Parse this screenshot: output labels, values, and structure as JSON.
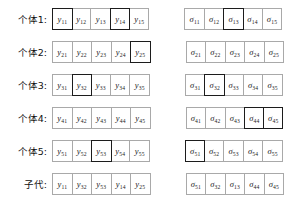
{
  "figure": {
    "type": "genetic-algorithm-crossover-diagram",
    "colors": {
      "cell_border": "#a9a9a9",
      "highlight_border": "#1c1c1c",
      "background": "#ffffff",
      "text": "#1a1a1a"
    },
    "columns": 5
  },
  "labels": {
    "individual_1": "个体1:",
    "individual_2": "个体2:",
    "individual_3": "个体3:",
    "individual_4": "个体4:",
    "individual_5": "个体5:",
    "offspring": "子代:"
  },
  "symbols": {
    "y": "y",
    "sigma": "σ"
  },
  "rows": [
    {
      "label_key": "individual_1",
      "y_cells": [
        {
          "base": "y",
          "sub": "11",
          "highlighted": true
        },
        {
          "base": "y",
          "sub": "12",
          "highlighted": false
        },
        {
          "base": "y",
          "sub": "13",
          "highlighted": false
        },
        {
          "base": "y",
          "sub": "14",
          "highlighted": true
        },
        {
          "base": "y",
          "sub": "15",
          "highlighted": false
        }
      ],
      "sigma_cells": [
        {
          "base": "σ",
          "sub": "11",
          "highlighted": false
        },
        {
          "base": "σ",
          "sub": "12",
          "highlighted": false
        },
        {
          "base": "σ",
          "sub": "13",
          "highlighted": true
        },
        {
          "base": "σ",
          "sub": "14",
          "highlighted": false
        },
        {
          "base": "σ",
          "sub": "15",
          "highlighted": false
        }
      ]
    },
    {
      "label_key": "individual_2",
      "y_cells": [
        {
          "base": "y",
          "sub": "21",
          "highlighted": false
        },
        {
          "base": "y",
          "sub": "22",
          "highlighted": false
        },
        {
          "base": "y",
          "sub": "23",
          "highlighted": false
        },
        {
          "base": "y",
          "sub": "24",
          "highlighted": false
        },
        {
          "base": "y",
          "sub": "25",
          "highlighted": true
        }
      ],
      "sigma_cells": [
        {
          "base": "σ",
          "sub": "21",
          "highlighted": false
        },
        {
          "base": "σ",
          "sub": "22",
          "highlighted": false
        },
        {
          "base": "σ",
          "sub": "23",
          "highlighted": false
        },
        {
          "base": "σ",
          "sub": "24",
          "highlighted": false
        },
        {
          "base": "σ",
          "sub": "25",
          "highlighted": false
        }
      ]
    },
    {
      "label_key": "individual_3",
      "y_cells": [
        {
          "base": "y",
          "sub": "31",
          "highlighted": false
        },
        {
          "base": "y",
          "sub": "32",
          "highlighted": true
        },
        {
          "base": "y",
          "sub": "33",
          "highlighted": false
        },
        {
          "base": "y",
          "sub": "34",
          "highlighted": false
        },
        {
          "base": "y",
          "sub": "35",
          "highlighted": false
        }
      ],
      "sigma_cells": [
        {
          "base": "σ",
          "sub": "31",
          "highlighted": false
        },
        {
          "base": "σ",
          "sub": "32",
          "highlighted": true
        },
        {
          "base": "σ",
          "sub": "33",
          "highlighted": false
        },
        {
          "base": "σ",
          "sub": "34",
          "highlighted": false
        },
        {
          "base": "σ",
          "sub": "35",
          "highlighted": false
        }
      ]
    },
    {
      "label_key": "individual_4",
      "y_cells": [
        {
          "base": "y",
          "sub": "41",
          "highlighted": false
        },
        {
          "base": "y",
          "sub": "42",
          "highlighted": false
        },
        {
          "base": "y",
          "sub": "43",
          "highlighted": false
        },
        {
          "base": "y",
          "sub": "44",
          "highlighted": false
        },
        {
          "base": "y",
          "sub": "45",
          "highlighted": false
        }
      ],
      "sigma_cells": [
        {
          "base": "σ",
          "sub": "41",
          "highlighted": false
        },
        {
          "base": "σ",
          "sub": "42",
          "highlighted": false
        },
        {
          "base": "σ",
          "sub": "43",
          "highlighted": false
        },
        {
          "base": "σ",
          "sub": "44",
          "highlighted": true
        },
        {
          "base": "σ",
          "sub": "45",
          "highlighted": true
        }
      ]
    },
    {
      "label_key": "individual_5",
      "y_cells": [
        {
          "base": "y",
          "sub": "51",
          "highlighted": false
        },
        {
          "base": "y",
          "sub": "52",
          "highlighted": false
        },
        {
          "base": "y",
          "sub": "53",
          "highlighted": true
        },
        {
          "base": "y",
          "sub": "54",
          "highlighted": false
        },
        {
          "base": "y",
          "sub": "55",
          "highlighted": false
        }
      ],
      "sigma_cells": [
        {
          "base": "σ",
          "sub": "51",
          "highlighted": true
        },
        {
          "base": "σ",
          "sub": "52",
          "highlighted": false
        },
        {
          "base": "σ",
          "sub": "53",
          "highlighted": false
        },
        {
          "base": "σ",
          "sub": "54",
          "highlighted": false
        },
        {
          "base": "σ",
          "sub": "55",
          "highlighted": false
        }
      ]
    },
    {
      "label_key": "offspring",
      "y_cells": [
        {
          "base": "y",
          "sub": "11",
          "highlighted": false
        },
        {
          "base": "y",
          "sub": "32",
          "highlighted": false
        },
        {
          "base": "y",
          "sub": "53",
          "highlighted": false
        },
        {
          "base": "y",
          "sub": "14",
          "highlighted": false
        },
        {
          "base": "y",
          "sub": "25",
          "highlighted": false
        }
      ],
      "sigma_cells": [
        {
          "base": "σ",
          "sub": "51",
          "highlighted": false
        },
        {
          "base": "σ",
          "sub": "32",
          "highlighted": false
        },
        {
          "base": "σ",
          "sub": "13",
          "highlighted": false
        },
        {
          "base": "σ",
          "sub": "44",
          "highlighted": false
        },
        {
          "base": "σ",
          "sub": "45",
          "highlighted": false
        }
      ]
    }
  ]
}
